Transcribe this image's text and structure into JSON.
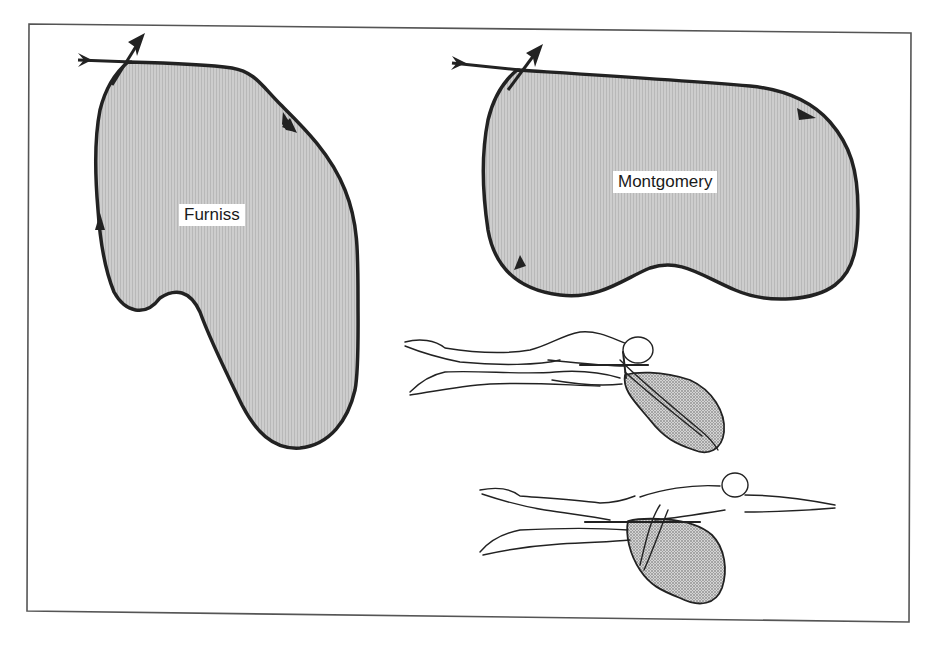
{
  "figure": {
    "labels": {
      "furniss": "Furniss",
      "montgomery": "Montgomery"
    },
    "colors": {
      "outline": "#222222",
      "fill": "#c8c8c8",
      "dotted_fill": "#9a9a9a",
      "frame": "#555555",
      "background": "#ffffff"
    },
    "panels": [
      {
        "name": "furniss-pull-pattern",
        "label_key": "furniss"
      },
      {
        "name": "montgomery-pull-pattern",
        "label_key": "montgomery"
      },
      {
        "name": "swimmer-upper",
        "description": "freestyle swimmer with pull-pattern overlay"
      },
      {
        "name": "swimmer-lower",
        "description": "freestyle swimmer with arm extended and pull-pattern overlay"
      }
    ]
  }
}
